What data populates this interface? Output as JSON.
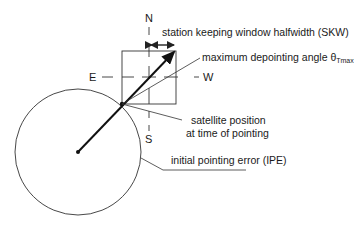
{
  "diagram": {
    "compass": {
      "north": "N",
      "south": "S",
      "east": "E",
      "west": "W"
    },
    "labels": {
      "skw": "station keeping window halfwidth (SKW)",
      "depointing_prefix": "maximum depointing angle θ",
      "depointing_sub": "Tmax",
      "satellite_line1": "satellite position",
      "satellite_line2": "at time of pointing",
      "ipe": "initial pointing error (IPE)"
    },
    "colors": {
      "line": "#222222",
      "background": "#ffffff"
    }
  }
}
